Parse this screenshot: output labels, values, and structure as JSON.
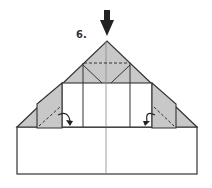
{
  "diagram": {
    "type": "origami-instruction",
    "step_number": "6.",
    "colors": {
      "paper_back": "#c8c8c8",
      "paper_front": "#ffffff",
      "line": "#333333",
      "arrow": "#222222"
    },
    "elements": {
      "push_arrow": "push-down-arrow",
      "valley_fold_lines": [
        "top-horizontal-dashed",
        "left-flap-diagonal-dashed",
        "right-flap-diagonal-dashed"
      ],
      "fold_arrows": [
        "left-flap-fold-arrow",
        "right-flap-fold-arrow"
      ]
    }
  }
}
